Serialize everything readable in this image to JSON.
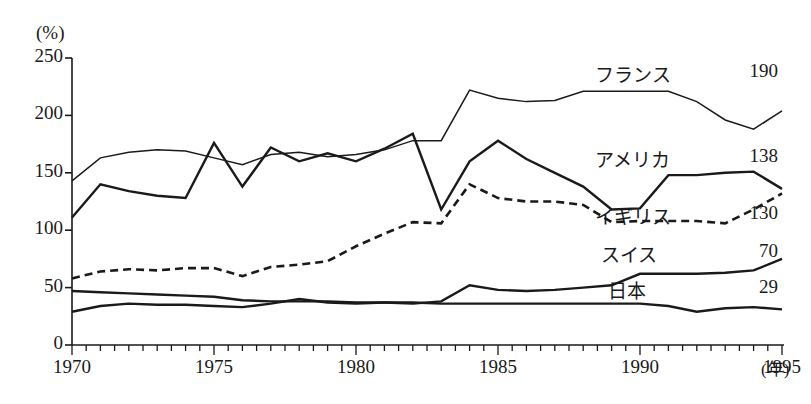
{
  "chart_data": {
    "type": "line",
    "title": "",
    "subtitle": "",
    "xlabel": "年",
    "ylabel": "(%)",
    "ylim": [
      0,
      250
    ],
    "xlim": [
      1970,
      1995
    ],
    "y_ticks": [
      0,
      50,
      100,
      150,
      200,
      250
    ],
    "x_ticks": [
      1970,
      1975,
      1980,
      1985,
      1990,
      1995
    ],
    "x_minor_tick_interval": 1,
    "grid": false,
    "legend_position": "right-inline",
    "x": [
      1970,
      1971,
      1972,
      1973,
      1974,
      1975,
      1976,
      1977,
      1978,
      1979,
      1980,
      1981,
      1982,
      1983,
      1984,
      1985,
      1986,
      1987,
      1988,
      1989,
      1990,
      1991,
      1992,
      1993,
      1994,
      1995
    ],
    "series": [
      {
        "name": "フランス",
        "end_value": "190",
        "style": "solid-thin",
        "values": [
          143,
          163,
          168,
          170,
          169,
          163,
          157,
          166,
          168,
          164,
          166,
          170,
          178,
          178,
          222,
          215,
          212,
          213,
          221,
          221,
          221,
          221,
          212,
          196,
          188,
          204
        ]
      },
      {
        "name": "アメリカ",
        "end_value": "138",
        "style": "solid-thick",
        "values": [
          111,
          140,
          134,
          130,
          128,
          176,
          138,
          172,
          160,
          167,
          160,
          171,
          184,
          118,
          160,
          178,
          162,
          150,
          138,
          118,
          119,
          148,
          148,
          150,
          151,
          136
        ]
      },
      {
        "name": "イギリス",
        "end_value": "130",
        "style": "dashed",
        "values": [
          58,
          64,
          66,
          65,
          67,
          67,
          60,
          68,
          70,
          73,
          86,
          97,
          107,
          106,
          140,
          128,
          125,
          125,
          122,
          107,
          108,
          108,
          108,
          106,
          118,
          132
        ]
      },
      {
        "name": "スイス",
        "end_value": "70",
        "style": "solid-thick",
        "values": [
          47,
          46,
          45,
          44,
          43,
          42,
          39,
          38,
          38,
          38,
          37,
          37,
          36,
          38,
          52,
          48,
          47,
          48,
          50,
          52,
          62,
          62,
          62,
          63,
          65,
          75
        ]
      },
      {
        "name": "日本",
        "end_value": "29",
        "style": "solid-thick",
        "values": [
          29,
          34,
          36,
          35,
          35,
          34,
          33,
          36,
          40,
          37,
          36,
          37,
          37,
          36,
          36,
          36,
          36,
          36,
          36,
          36,
          36,
          34,
          29,
          32,
          33,
          31
        ]
      }
    ]
  },
  "axis": {
    "unit_label": "(%)",
    "x_unit_suffix": "(年)",
    "y_tick_labels": [
      "250",
      "200",
      "150",
      "100",
      "50",
      "0"
    ],
    "x_tick_labels": [
      "1970",
      "1975",
      "1980",
      "1985",
      "1990",
      "1995"
    ]
  },
  "colors": {
    "line": "#1a1a1a",
    "axis": "#1a1a1a",
    "background": "#ffffff"
  }
}
